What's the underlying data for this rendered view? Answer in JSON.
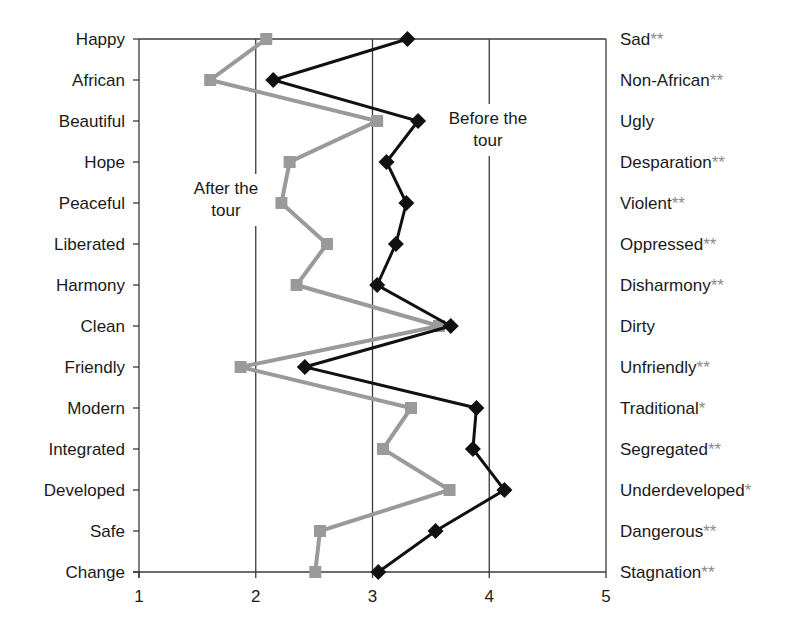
{
  "chart_data": {
    "type": "line",
    "title": "",
    "xlabel": "",
    "ylabel": "",
    "xlim": [
      1,
      5
    ],
    "x_ticks": [
      "1",
      "2",
      "3",
      "4",
      "5"
    ],
    "grid": "vertical gridlines at 2, 3, 4",
    "orientation": "horizontal semantic differential (categories on y-axis)",
    "left_labels": [
      "Happy",
      "African",
      "Beautiful",
      "Hope",
      "Peaceful",
      "Liberated",
      "Harmony",
      "Clean",
      "Friendly",
      "Modern",
      "Integrated",
      "Developed",
      "Safe",
      "Change"
    ],
    "right_labels": [
      {
        "text": "Sad",
        "sig": "**"
      },
      {
        "text": "Non-African",
        "sig": "**"
      },
      {
        "text": "Ugly",
        "sig": ""
      },
      {
        "text": "Desparation",
        "sig": "**"
      },
      {
        "text": "Violent",
        "sig": "**"
      },
      {
        "text": "Oppressed",
        "sig": "**"
      },
      {
        "text": "Disharmony",
        "sig": "**"
      },
      {
        "text": "Dirty",
        "sig": ""
      },
      {
        "text": "Unfriendly",
        "sig": "**"
      },
      {
        "text": "Traditional",
        "sig": "*"
      },
      {
        "text": "Segregated",
        "sig": "**"
      },
      {
        "text": "Underdeveloped",
        "sig": "*"
      },
      {
        "text": "Dangerous",
        "sig": "**"
      },
      {
        "text": "Stagnation",
        "sig": "**"
      }
    ],
    "series": [
      {
        "name": "Before the tour",
        "marker": "diamond",
        "color": "#111111",
        "values": [
          3.3,
          2.15,
          3.39,
          3.12,
          3.29,
          3.2,
          3.04,
          3.67,
          2.42,
          3.89,
          3.86,
          4.13,
          3.54,
          3.05
        ]
      },
      {
        "name": "After the tour",
        "marker": "square",
        "color": "#9a9a9a",
        "values": [
          2.09,
          1.61,
          3.04,
          2.29,
          2.22,
          2.61,
          2.35,
          3.57,
          1.87,
          3.33,
          3.09,
          3.66,
          2.55,
          2.51
        ]
      }
    ],
    "annotations": [
      {
        "text_line1": "Before the",
        "text_line2": "tour",
        "series": "Before the tour"
      },
      {
        "text_line1": "After the",
        "text_line2": "tour",
        "series": "After the tour"
      }
    ]
  }
}
